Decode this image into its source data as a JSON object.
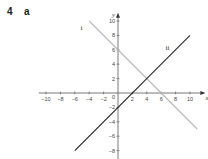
{
  "question": {
    "number": "4",
    "part": "a"
  },
  "chart_data": {
    "type": "line",
    "title": "",
    "xlabel": "x",
    "ylabel": "y",
    "xlim": [
      -11,
      12
    ],
    "ylim": [
      -10,
      11
    ],
    "x_ticks": [
      -10,
      -8,
      -6,
      -4,
      -2,
      2,
      4,
      6,
      8,
      10
    ],
    "y_ticks": [
      10,
      8,
      6,
      4,
      2,
      -2,
      -4,
      -6,
      -8
    ],
    "origin_label": "0",
    "grid": false,
    "series": [
      {
        "name": "i",
        "equation": "y = -x + 6",
        "color": "#b8b8b8",
        "x": [
          -4,
          11
        ],
        "y": [
          10,
          -5
        ]
      },
      {
        "name": "ii",
        "equation": "y = x - 2",
        "color": "#222222",
        "x": [
          -6,
          10
        ],
        "y": [
          -8,
          8
        ]
      }
    ]
  }
}
